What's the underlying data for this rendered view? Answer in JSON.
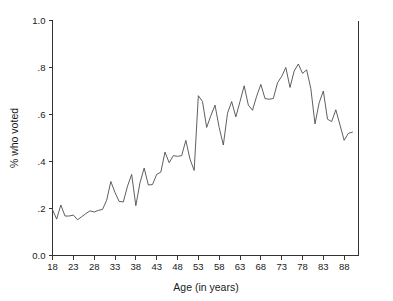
{
  "chart_data": {
    "type": "line",
    "title": "",
    "xlabel": "Age (in years)",
    "ylabel": "% who voted",
    "xlim": [
      18,
      90
    ],
    "ylim": [
      0.0,
      1.0
    ],
    "grid": false,
    "legend": null,
    "xticks": [
      18,
      23,
      28,
      33,
      38,
      43,
      48,
      53,
      58,
      63,
      68,
      73,
      78,
      83,
      88
    ],
    "xtick_labels": [
      "18",
      "23",
      "28",
      "33",
      "38",
      "43",
      "48",
      "53",
      "58",
      "63",
      "68",
      "73",
      "78",
      "83",
      "88"
    ],
    "yticks": [
      0.0,
      0.2,
      0.4,
      0.6,
      0.8,
      1.0
    ],
    "ytick_labels": [
      "0.0",
      ".2",
      ".4",
      ".6",
      ".8",
      "1.0"
    ],
    "line_color": "#4d4d4d",
    "axis_color": "#333333",
    "background_color": "#ffffff",
    "x": [
      18,
      19,
      20,
      21,
      22,
      23,
      24,
      25,
      26,
      27,
      28,
      29,
      30,
      31,
      32,
      33,
      34,
      35,
      36,
      37,
      38,
      39,
      40,
      41,
      42,
      43,
      44,
      45,
      46,
      47,
      48,
      49,
      50,
      51,
      52,
      53,
      54,
      55,
      56,
      57,
      58,
      59,
      60,
      61,
      62,
      63,
      64,
      65,
      66,
      67,
      68,
      69,
      70,
      71,
      72,
      73,
      74,
      75,
      76,
      77,
      78,
      79,
      80,
      81,
      82,
      83,
      84,
      85,
      86,
      87,
      88,
      89,
      90
    ],
    "y": [
      0.195,
      0.155,
      0.215,
      0.168,
      0.168,
      0.172,
      0.152,
      0.165,
      0.178,
      0.19,
      0.185,
      0.192,
      0.196,
      0.235,
      0.315,
      0.268,
      0.23,
      0.228,
      0.295,
      0.345,
      0.212,
      0.31,
      0.372,
      0.3,
      0.302,
      0.345,
      0.355,
      0.44,
      0.395,
      0.425,
      0.422,
      0.425,
      0.49,
      0.41,
      0.362,
      0.68,
      0.655,
      0.545,
      0.595,
      0.64,
      0.545,
      0.47,
      0.605,
      0.655,
      0.59,
      0.655,
      0.722,
      0.64,
      0.618,
      0.678,
      0.728,
      0.668,
      0.665,
      0.668,
      0.735,
      0.762,
      0.8,
      0.715,
      0.785,
      0.815,
      0.775,
      0.79,
      0.71,
      0.56,
      0.65,
      0.7,
      0.58,
      0.57,
      0.62,
      0.555,
      0.49,
      0.52,
      0.525
    ]
  },
  "axis_titles": {
    "x": "Age (in years)",
    "y": "% who voted"
  }
}
